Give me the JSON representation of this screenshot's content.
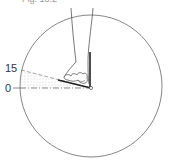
{
  "figure": {
    "caption": "Fig. 13.2",
    "labels": {
      "upper_angle": "15",
      "baseline": "0"
    },
    "colors": {
      "line": "#555555",
      "shading": "#b0b0b0"
    }
  }
}
